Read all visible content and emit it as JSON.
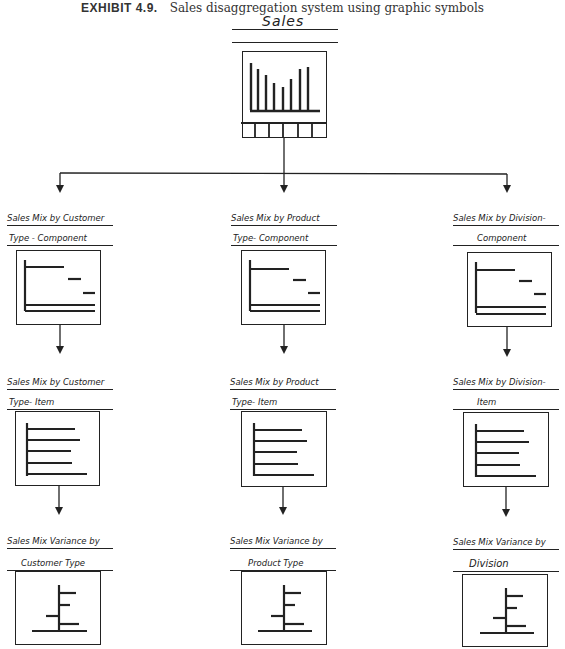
{
  "caption": {
    "number": "EXHIBIT 4.9.",
    "text": "Sales disaggregation system using graphic symbols"
  },
  "root": {
    "label": "Sales",
    "symbol": "vertical-bar-chart-with-period-strip",
    "bars_relative_heights": [
      0.95,
      0.85,
      0.78,
      0.62,
      0.55,
      0.7,
      0.86,
      0.9
    ],
    "strip_cells": 6
  },
  "columns": [
    {
      "dimension": "Customer Type",
      "component": {
        "label_line1": "Sales Mix by Customer",
        "label_line2": "Type - Component"
      },
      "item": {
        "label_line1": "Sales Mix by Customer",
        "label_line2": "Type-  Item"
      },
      "variance": {
        "label_line1": "Sales Mix Variance by",
        "label_line2": "Customer Type"
      }
    },
    {
      "dimension": "Product Type",
      "component": {
        "label_line1": "Sales Mix by Product",
        "label_line2": "Type-  Component"
      },
      "item": {
        "label_line1": "Sales Mix by Product",
        "label_line2": "Type-  Item"
      },
      "variance": {
        "label_line1": "Sales Mix Variance by",
        "label_line2": "Product Type"
      }
    },
    {
      "dimension": "Division",
      "component": {
        "label_line1": "Sales Mix by Division-",
        "label_line2": "Component"
      },
      "item": {
        "label_line1": "Sales Mix by Division-",
        "label_line2": "Item"
      },
      "variance": {
        "label_line1": "Sales Mix Variance by",
        "label_line2": "Division"
      }
    }
  ],
  "symbols": {
    "component": "waterfall-horizontal-bars",
    "item": "horizontal-bar-chart-5-bars",
    "variance": "variance-bar-chart-centered-axis"
  },
  "colors": {
    "ink": "#222222",
    "paper": "#ffffff"
  }
}
